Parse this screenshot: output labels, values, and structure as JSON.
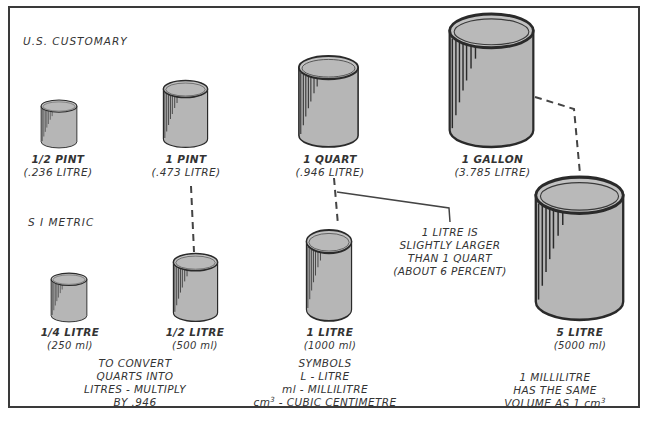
{
  "sections": {
    "us_customary": "U.S. CUSTOMARY",
    "si_metric": "S I  METRIC"
  },
  "us_containers": [
    {
      "name": "1/2 PINT",
      "value": "(.236 LITRE)"
    },
    {
      "name": "1 PINT",
      "value": "(.473 LITRE)"
    },
    {
      "name": "1 QUART",
      "value": "(.946 LITRE)"
    },
    {
      "name": "1 GALLON",
      "value": "(3.785 LITRE)"
    }
  ],
  "metric_containers": [
    {
      "name": "1/4 LITRE",
      "value": "(250 ml)"
    },
    {
      "name": "1/2 LITRE",
      "value": "(500 ml)"
    },
    {
      "name": "1 LITRE",
      "value": "(1000 ml)"
    },
    {
      "name": "5 LITRE",
      "value": "(5000 ml)"
    }
  ],
  "notes": {
    "litre_vs_quart": [
      "1 LITRE IS",
      "SLIGHTLY LARGER",
      "THAN 1 QUART",
      "(ABOUT 6 PERCENT)"
    ],
    "convert": [
      "TO CONVERT",
      "QUARTS INTO",
      "LITRES - MULTIPLY",
      "BY .946"
    ],
    "symbols": {
      "title": "SYMBOLS",
      "lines": [
        "L - LITRE",
        "ml - MILLILITRE"
      ],
      "cm_prefix": "cm",
      "cm_exp": "3",
      "cm_suffix": " - CUBIC CENTIMETRE"
    },
    "millilitre": {
      "line1": "1 MILLILITRE",
      "line2": "HAS THE SAME",
      "line3_prefix": "VOLUME AS 1 cm",
      "line3_exp": "3"
    }
  },
  "colors": {
    "cylinder_fill": "#b8b8b8",
    "cylinder_top": "#bdbdbd",
    "outline": "#2a2a2a",
    "text": "#333333"
  }
}
